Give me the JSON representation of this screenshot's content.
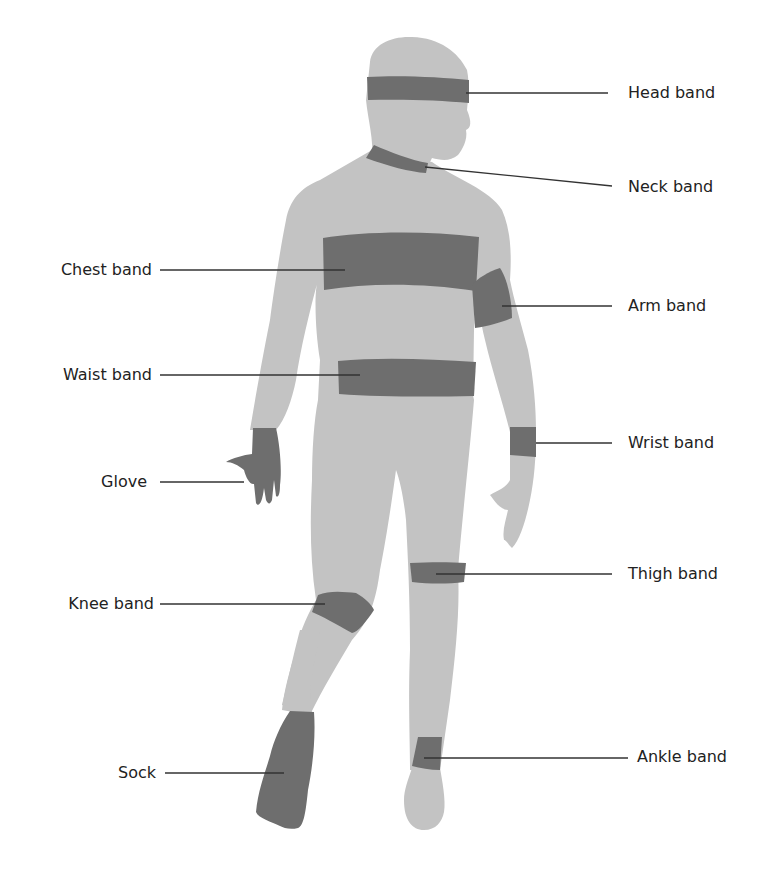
{
  "figure": {
    "colors": {
      "body": "#c3c3c3",
      "band": "#6e6e6e",
      "leader": "#333333",
      "background": "#ffffff"
    },
    "labels": {
      "head_band": "Head band",
      "neck_band": "Neck band",
      "chest_band": "Chest band",
      "arm_band": "Arm band",
      "waist_band": "Waist band",
      "wrist_band": "Wrist band",
      "glove": "Glove",
      "thigh_band": "Thigh band",
      "knee_band": "Knee band",
      "ankle_band": "Ankle band",
      "sock": "Sock"
    }
  }
}
